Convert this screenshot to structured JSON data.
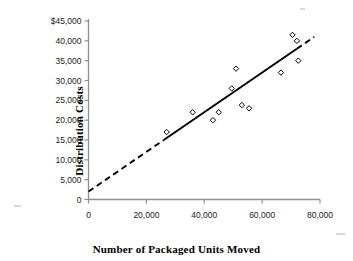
{
  "chart_data": {
    "type": "scatter",
    "title": "",
    "xlabel": "Number of Packaged Units Moved",
    "ylabel": "Distribution Costs",
    "xlim": [
      0,
      80000
    ],
    "ylim": [
      0,
      45000
    ],
    "grid": false,
    "legend": "none",
    "x_ticks": [
      0,
      20000,
      40000,
      60000,
      80000
    ],
    "x_tick_labels": [
      "0",
      "20,000",
      "40,000",
      "60,000",
      "80,000"
    ],
    "y_ticks": [
      0,
      5000,
      10000,
      15000,
      20000,
      25000,
      30000,
      35000,
      40000,
      45000
    ],
    "y_tick_labels": [
      "0",
      "5,000",
      "10,000",
      "15,000",
      "20,000",
      "25,000",
      "30,000",
      "35,000",
      "40,000",
      "$45,000"
    ],
    "series": [
      {
        "name": "Observations",
        "marker": "open-diamond",
        "marker_color": "#000000",
        "points": [
          {
            "x": 27000,
            "y": 17000
          },
          {
            "x": 36000,
            "y": 22000
          },
          {
            "x": 43000,
            "y": 20000
          },
          {
            "x": 45000,
            "y": 22000
          },
          {
            "x": 49500,
            "y": 28000
          },
          {
            "x": 51000,
            "y": 33000
          },
          {
            "x": 53000,
            "y": 23800
          },
          {
            "x": 55500,
            "y": 23000
          },
          {
            "x": 66500,
            "y": 32000
          },
          {
            "x": 70500,
            "y": 41500
          },
          {
            "x": 72000,
            "y": 40000
          },
          {
            "x": 72500,
            "y": 35000
          }
        ]
      }
    ],
    "trend_line": {
      "name": "Regression line",
      "color": "#000000",
      "intercept": 2000,
      "slope": 0.5,
      "solid_segment_x": [
        26000,
        72000
      ],
      "dashed_segment_low_x": [
        0,
        26000
      ],
      "dashed_segment_high_x": [
        72000,
        78000
      ]
    }
  },
  "axes": {
    "x_title": "Number of Packaged Units Moved",
    "y_title": "Distribution Costs",
    "axis_color": "#8a8a8a"
  }
}
